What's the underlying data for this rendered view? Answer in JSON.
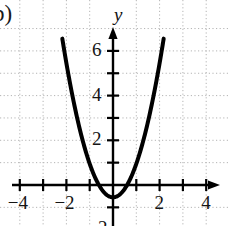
{
  "figure": {
    "part_label": "b)",
    "y_axis_name": "y",
    "x_axis_name": ""
  },
  "chart_data": {
    "type": "line",
    "title": "",
    "subtitle": "",
    "xlabel": "",
    "ylabel": "y",
    "xlim": [
      -4.9,
      4.9
    ],
    "ylim": [
      -1.8,
      7.2
    ],
    "grid": true,
    "grid_style": "dotted",
    "grid_spacing": 1,
    "legend": "none",
    "x_ticks": [
      -4,
      -3,
      -2,
      -1,
      0,
      1,
      2,
      3,
      4
    ],
    "x_tick_labels": [
      "-4",
      "",
      "-2",
      "",
      "",
      "",
      "2",
      "",
      "4"
    ],
    "y_ticks": [
      -1,
      1,
      2,
      3,
      4,
      5,
      6
    ],
    "y_tick_labels": [
      "",
      "",
      "2",
      "",
      "4",
      "",
      "6"
    ],
    "x_labeled": [
      {
        "value": -4,
        "label": "−4"
      },
      {
        "value": -2,
        "label": "−2"
      },
      {
        "value": 2,
        "label": "2"
      },
      {
        "value": 4,
        "label": "4"
      }
    ],
    "y_labeled": [
      {
        "value": 2,
        "label": "2"
      },
      {
        "value": 4,
        "label": "4"
      },
      {
        "value": 6,
        "label": "6"
      }
    ],
    "partial_bottom_label": "2",
    "series": [
      {
        "name": "parabola",
        "equation": "y = 1.5x^2 - 0.55",
        "vertex": [
          0,
          -0.55
        ],
        "a": 1.5,
        "color": "#000000",
        "line_width": 4,
        "x_range": [
          -2.95,
          2.95
        ],
        "x_intercepts": [
          -0.61,
          0.61
        ],
        "points": [
          {
            "x": -2.95,
            "y": 12.5
          },
          {
            "x": -2.5,
            "y": 8.83
          },
          {
            "x": -2.0,
            "y": 5.45
          },
          {
            "x": -1.5,
            "y": 2.83
          },
          {
            "x": -1.0,
            "y": 0.95
          },
          {
            "x": -0.5,
            "y": -0.18
          },
          {
            "x": 0.0,
            "y": -0.55
          },
          {
            "x": 0.5,
            "y": -0.18
          },
          {
            "x": 1.0,
            "y": 0.95
          },
          {
            "x": 1.5,
            "y": 2.83
          },
          {
            "x": 2.0,
            "y": 5.45
          },
          {
            "x": 2.5,
            "y": 8.83
          },
          {
            "x": 2.95,
            "y": 12.5
          }
        ]
      }
    ],
    "axis_color": "#000000",
    "grid_color": "#b4b4b4",
    "background": "#ffffff"
  }
}
